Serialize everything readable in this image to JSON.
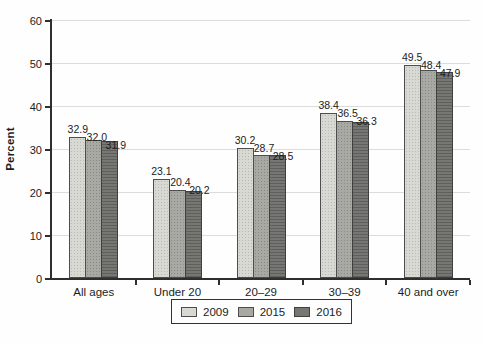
{
  "figure": {
    "background": "#fefefe"
  },
  "chart_data": {
    "type": "bar",
    "title": "",
    "xlabel": "",
    "ylabel": "Percent",
    "categories": [
      "All ages",
      "Under 20",
      "20–29",
      "30–39",
      "40 and over"
    ],
    "series": [
      {
        "name": "2009",
        "color": "#d9d9d4",
        "border": "#4d4d4d",
        "texture": "dots-light",
        "values": [
          32.9,
          23.1,
          30.2,
          38.4,
          49.5
        ]
      },
      {
        "name": "2015",
        "color": "#a9a9a4",
        "border": "#4d4d4d",
        "texture": "dots-medium",
        "values": [
          32.0,
          20.4,
          28.7,
          36.5,
          48.4
        ]
      },
      {
        "name": "2016",
        "color": "#767672",
        "border": "#3f3f3f",
        "texture": "hlines",
        "values": [
          31.9,
          20.2,
          28.5,
          36.3,
          47.9
        ]
      }
    ],
    "ylim": [
      0,
      60
    ],
    "yticks": [
      0,
      10,
      20,
      30,
      40,
      50,
      60
    ],
    "grid": true,
    "legend_position": "bottom",
    "value_label_decimals": 1,
    "colors": {
      "axis": "#2e2e2e",
      "grid": "#dcdcdc",
      "text": "#1c1c1c",
      "background": "#fefefe"
    }
  }
}
